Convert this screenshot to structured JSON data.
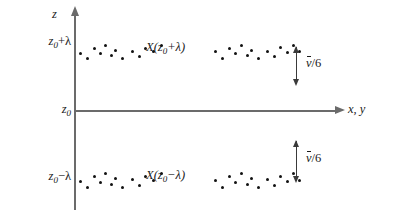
{
  "figure": {
    "type": "kinetic-theory-transport-diagram",
    "axes": {
      "vertical_label": "z",
      "horizontal_label": "x, y",
      "origin_tick": "z",
      "origin_tick_sub": "0"
    },
    "ticks": [
      {
        "name": "upper-plane",
        "base": "z",
        "sub": "0",
        "offset": "+λ",
        "value_text": "z0+λ"
      },
      {
        "name": "origin-plane",
        "base": "z",
        "sub": "0",
        "offset": "",
        "value_text": "z0"
      },
      {
        "name": "lower-plane",
        "base": "z",
        "sub": "0",
        "offset": "−λ",
        "value_text": "z0−λ"
      }
    ],
    "bands": [
      {
        "name": "upper-band",
        "label": "X(z₀+λ)",
        "label_base": "X(z",
        "label_sub": "0",
        "label_tail": "+λ)",
        "flux_label_numerator": "v",
        "flux_label_denominator": "/6",
        "flux_label_full": "v̄/6",
        "flux_direction": "down"
      },
      {
        "name": "lower-band",
        "label": "X(z₀−λ)",
        "label_base": "X(z",
        "label_sub": "0",
        "label_tail": "−λ)",
        "flux_label_numerator": "v",
        "flux_label_denominator": "/6",
        "flux_label_full": "v̄/6",
        "flux_direction": "up"
      }
    ],
    "colors": {
      "axis": "#6b6b6b",
      "dot": "#121212",
      "arrow": "#3a3a3a",
      "text": "#1a1a1a",
      "background": "#ffffff"
    },
    "molecules": {
      "upper": [
        [
          79,
          52
        ],
        [
          86,
          57
        ],
        [
          93,
          47
        ],
        [
          99,
          52
        ],
        [
          104,
          44
        ],
        [
          110,
          54
        ],
        [
          114,
          49
        ],
        [
          121,
          57
        ],
        [
          131,
          50
        ],
        [
          138,
          55
        ],
        [
          144,
          47
        ],
        [
          152,
          50
        ],
        [
          160,
          44
        ],
        [
          214,
          50
        ],
        [
          221,
          57
        ],
        [
          228,
          47
        ],
        [
          234,
          52
        ],
        [
          240,
          44
        ],
        [
          246,
          54
        ],
        [
          250,
          49
        ],
        [
          257,
          57
        ],
        [
          266,
          50
        ],
        [
          273,
          55
        ],
        [
          279,
          46
        ],
        [
          286,
          51
        ],
        [
          292,
          44
        ],
        [
          298,
          50
        ]
      ],
      "lower": [
        [
          79,
          180
        ],
        [
          86,
          186
        ],
        [
          93,
          175
        ],
        [
          99,
          181
        ],
        [
          104,
          172
        ],
        [
          110,
          183
        ],
        [
          114,
          177
        ],
        [
          121,
          186
        ],
        [
          131,
          178
        ],
        [
          138,
          184
        ],
        [
          144,
          175
        ],
        [
          152,
          179
        ],
        [
          160,
          172
        ],
        [
          214,
          179
        ],
        [
          221,
          186
        ],
        [
          228,
          175
        ],
        [
          234,
          181
        ],
        [
          240,
          172
        ],
        [
          246,
          183
        ],
        [
          250,
          177
        ],
        [
          257,
          186
        ],
        [
          266,
          178
        ],
        [
          273,
          184
        ],
        [
          279,
          175
        ],
        [
          286,
          180
        ],
        [
          292,
          172
        ],
        [
          298,
          179
        ]
      ]
    }
  }
}
